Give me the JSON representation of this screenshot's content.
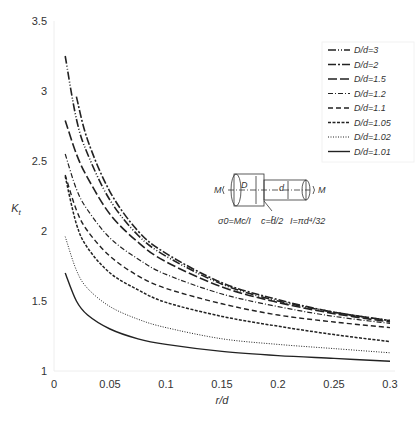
{
  "chart_data": {
    "type": "line",
    "title": "",
    "xlabel": "r/d",
    "ylabel": "Kt",
    "xlim": [
      0,
      0.3
    ],
    "ylim": [
      1,
      3.5
    ],
    "grid": false,
    "legend_position": "upper right",
    "x_ticks": [
      "0",
      "0.05",
      "0.1",
      "0.15",
      "0.2",
      "0.25",
      "0.3"
    ],
    "y_ticks": [
      "1",
      "1.5",
      "2",
      "2.5",
      "3",
      "3.5"
    ],
    "x": [
      0.01,
      0.02,
      0.03,
      0.05,
      0.075,
      0.1,
      0.15,
      0.2,
      0.25,
      0.3
    ],
    "series": [
      {
        "name": "D/d=3",
        "style": "dash-dot-dot",
        "values": [
          3.25,
          2.8,
          2.55,
          2.22,
          1.97,
          1.82,
          1.62,
          1.5,
          1.42,
          1.36
        ]
      },
      {
        "name": "D/d=2",
        "style": "dash-dot",
        "values": [
          null,
          2.96,
          2.65,
          2.28,
          2.0,
          1.84,
          1.63,
          1.51,
          1.42,
          1.36
        ]
      },
      {
        "name": "D/d=1.5",
        "style": "long-dash",
        "values": [
          2.79,
          2.55,
          2.38,
          2.12,
          1.92,
          1.78,
          1.6,
          1.49,
          1.41,
          1.35
        ]
      },
      {
        "name": "D/d=1.2",
        "style": "dash-dot-short",
        "values": [
          2.55,
          2.3,
          2.15,
          1.95,
          1.8,
          1.69,
          1.55,
          1.46,
          1.39,
          1.34
        ]
      },
      {
        "name": "D/d=1.1",
        "style": "medium-dash",
        "values": [
          2.4,
          2.15,
          2.0,
          1.82,
          1.68,
          1.59,
          1.48,
          1.4,
          1.35,
          1.31
        ]
      },
      {
        "name": "D/d=1.05",
        "style": "short-dash",
        "values": [
          2.39,
          2.05,
          1.88,
          1.7,
          1.58,
          1.49,
          1.39,
          1.32,
          1.26,
          1.21
        ]
      },
      {
        "name": "D/d=1.02",
        "style": "dotted",
        "values": [
          1.96,
          1.72,
          1.59,
          1.46,
          1.37,
          1.31,
          1.23,
          1.19,
          1.16,
          1.13
        ]
      },
      {
        "name": "D/d=1.01",
        "style": "solid",
        "values": [
          1.7,
          1.5,
          1.4,
          1.3,
          1.23,
          1.19,
          1.14,
          1.11,
          1.09,
          1.07
        ]
      }
    ],
    "annotations": {
      "moment_left": "M",
      "moment_right": "M",
      "dim_D": "D",
      "dim_d": "d",
      "fillet": "r",
      "formula_1": "σ0=Mc/I",
      "formula_2": "c=d/2",
      "formula_3": "I=πd⁴/32"
    }
  }
}
